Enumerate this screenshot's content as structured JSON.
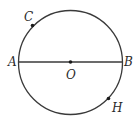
{
  "diagram": {
    "title": "",
    "shapes": [
      {
        "type": "circle",
        "name": "circle-O",
        "center": "O"
      },
      {
        "type": "segment",
        "name": "diameter-AB",
        "from": "A",
        "to": "B"
      }
    ],
    "points": {
      "A": {
        "label": "A",
        "on": "circle",
        "dot": false
      },
      "B": {
        "label": "B",
        "on": "circle",
        "dot": false
      },
      "O": {
        "label": "O",
        "role": "center",
        "dot": true
      },
      "C": {
        "label": "C",
        "on": "circle",
        "dot": true
      },
      "H": {
        "label": "H",
        "on": "circle",
        "dot": true
      }
    }
  }
}
